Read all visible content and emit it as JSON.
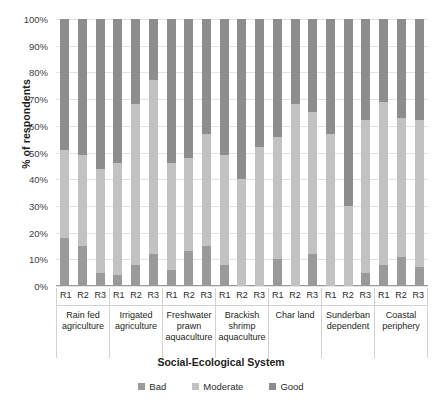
{
  "chart_data": {
    "type": "bar",
    "subtype": "100% stacked column",
    "title": "",
    "xlabel": "Social-Ecological System",
    "ylabel": "% of respondents",
    "ylim": [
      0,
      100
    ],
    "ytick_labels": [
      "100%",
      "90%",
      "80%",
      "70%",
      "60%",
      "50%",
      "40%",
      "30%",
      "20%",
      "10%",
      "0%"
    ],
    "ytick_values": [
      100,
      90,
      80,
      70,
      60,
      50,
      40,
      30,
      20,
      10,
      0
    ],
    "grid": true,
    "legend_position": "bottom",
    "legend": [
      "Bad",
      "Moderate",
      "Good"
    ],
    "series_colors": {
      "Bad": "#9a9a9a",
      "Moderate": "#c2c2c2",
      "Good": "#8d8d8d"
    },
    "stack_order_bottom_to_top": [
      "Bad",
      "Moderate",
      "Good"
    ],
    "round_labels": [
      "R1",
      "R2",
      "R3"
    ],
    "categories": [
      "Rain fed agriculture",
      "Irrigated agriculture",
      "Freshwater prawn aquaculture",
      "Brackish shrimp aquaculture",
      "Char land",
      "Sunderban dependent",
      "Coastal periphery"
    ],
    "groups": [
      {
        "category": "Rain fed agriculture",
        "bars": [
          {
            "round": "R1",
            "Bad": 18,
            "Moderate": 33,
            "Good": 49
          },
          {
            "round": "R2",
            "Bad": 15,
            "Moderate": 34,
            "Good": 51
          },
          {
            "round": "R3",
            "Bad": 5,
            "Moderate": 39,
            "Good": 56
          }
        ]
      },
      {
        "category": "Irrigated agriculture",
        "bars": [
          {
            "round": "R1",
            "Bad": 4,
            "Moderate": 42,
            "Good": 54
          },
          {
            "round": "R2",
            "Bad": 8,
            "Moderate": 60,
            "Good": 32
          },
          {
            "round": "R3",
            "Bad": 12,
            "Moderate": 65,
            "Good": 23
          }
        ]
      },
      {
        "category": "Freshwater prawn aquaculture",
        "bars": [
          {
            "round": "R1",
            "Bad": 6,
            "Moderate": 40,
            "Good": 54
          },
          {
            "round": "R2",
            "Bad": 13,
            "Moderate": 35,
            "Good": 52
          },
          {
            "round": "R3",
            "Bad": 15,
            "Moderate": 42,
            "Good": 43
          }
        ]
      },
      {
        "category": "Brackish shrimp aquaculture",
        "bars": [
          {
            "round": "R1",
            "Bad": 8,
            "Moderate": 41,
            "Good": 51
          },
          {
            "round": "R2",
            "Bad": 0,
            "Moderate": 40,
            "Good": 60
          },
          {
            "round": "R3",
            "Bad": 0,
            "Moderate": 52,
            "Good": 48
          }
        ]
      },
      {
        "category": "Char land",
        "bars": [
          {
            "round": "R1",
            "Bad": 10,
            "Moderate": 46,
            "Good": 44
          },
          {
            "round": "R2",
            "Bad": 0,
            "Moderate": 68,
            "Good": 32
          },
          {
            "round": "R3",
            "Bad": 12,
            "Moderate": 53,
            "Good": 35
          }
        ]
      },
      {
        "category": "Sunderban dependent",
        "bars": [
          {
            "round": "R1",
            "Bad": 0,
            "Moderate": 57,
            "Good": 43
          },
          {
            "round": "R2",
            "Bad": 0,
            "Moderate": 30,
            "Good": 70
          },
          {
            "round": "R3",
            "Bad": 5,
            "Moderate": 57,
            "Good": 38
          }
        ]
      },
      {
        "category": "Coastal periphery",
        "bars": [
          {
            "round": "R1",
            "Bad": 8,
            "Moderate": 61,
            "Good": 31
          },
          {
            "round": "R2",
            "Bad": 11,
            "Moderate": 52,
            "Good": 37
          },
          {
            "round": "R3",
            "Bad": 7,
            "Moderate": 55,
            "Good": 38
          }
        ]
      }
    ]
  }
}
